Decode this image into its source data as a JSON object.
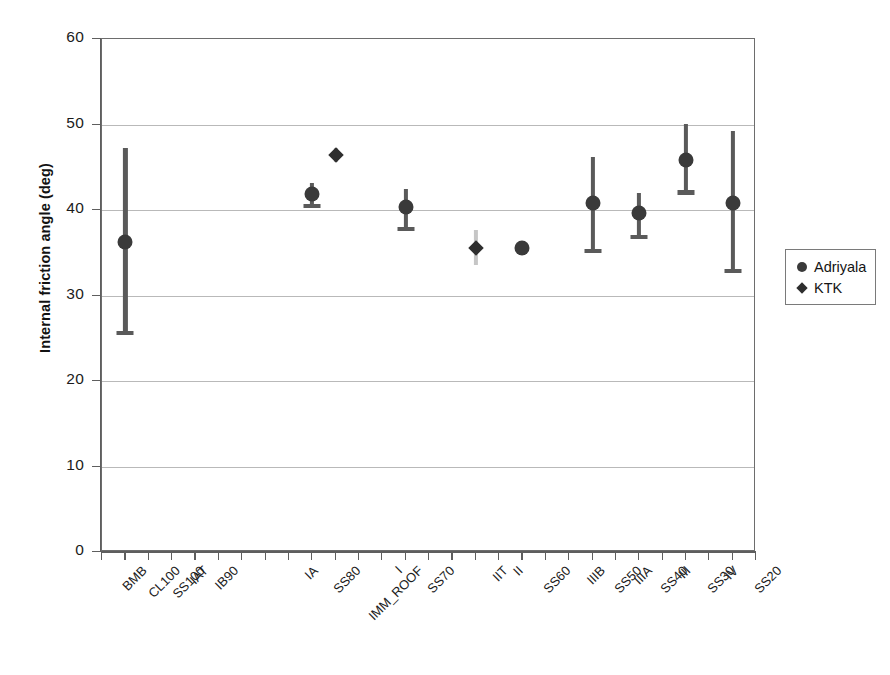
{
  "chart_data": {
    "type": "scatter",
    "title": "",
    "xlabel": "",
    "ylabel": "Internal friction angle (deg)",
    "ylim": [
      0,
      60
    ],
    "ytick_labels": [
      "60",
      "50",
      "40",
      "30",
      "20",
      "10",
      "0"
    ],
    "ytick_values": [
      60,
      50,
      40,
      30,
      20,
      10,
      0
    ],
    "grid": "horizontal",
    "legend_position": "right",
    "categories": [
      "BMB",
      "CL100",
      "SS100",
      "IAT",
      "IB90",
      "IA",
      "SS80",
      "IMM_ROOF",
      "I",
      "SS70",
      "IIT",
      "II",
      "SS60",
      "IIIB",
      "SS50",
      "IIIA",
      "SS40",
      "III",
      "SS30",
      "IV",
      "SS20"
    ],
    "category_tick_positions": [
      0,
      1,
      2,
      3,
      4,
      8,
      9,
      10,
      12,
      13,
      16,
      17,
      18,
      20,
      21,
      22,
      23,
      24,
      25,
      26,
      27
    ],
    "series": [
      {
        "name": "Adriyala",
        "marker": "circle",
        "color": "#3a3a3a",
        "points": [
          {
            "category": "BMB",
            "tick": 1,
            "value": 36.3,
            "err_low": 25.4,
            "err_high": 47.2
          },
          {
            "category": "SS80",
            "tick": 9,
            "value": 41.9,
            "err_low": 40.2,
            "err_high": 43.1
          },
          {
            "category": "SS70",
            "tick": 13,
            "value": 40.3,
            "err_low": 37.5,
            "err_high": 42.5
          },
          {
            "category": "SS60",
            "tick": 18,
            "value": 35.6,
            "err_low": 35.6,
            "err_high": 35.6
          },
          {
            "category": "SS50",
            "tick": 21,
            "value": 40.8,
            "err_low": 35.0,
            "err_high": 46.2
          },
          {
            "category": "SS40",
            "tick": 23,
            "value": 39.6,
            "err_low": 36.6,
            "err_high": 42.0
          },
          {
            "category": "SS30",
            "tick": 25,
            "value": 45.9,
            "err_low": 41.8,
            "err_high": 50.1
          },
          {
            "category": "SS20",
            "tick": 27,
            "value": 40.8,
            "err_low": 32.6,
            "err_high": 49.2
          }
        ]
      },
      {
        "name": "KTK",
        "marker": "diamond",
        "color": "#2e2e2e",
        "points": [
          {
            "category": "IMM_ROOF",
            "tick": 10,
            "value": 46.4,
            "err_low": 45.6,
            "err_high": 47.2
          },
          {
            "category": "IIT",
            "tick": 16,
            "value": 35.6,
            "err_low": 33.6,
            "err_high": 37.7
          }
        ]
      }
    ]
  },
  "legend": {
    "entries": [
      {
        "label": "Adriyala",
        "marker": "circle"
      },
      {
        "label": "KTK",
        "marker": "diamond"
      }
    ]
  }
}
